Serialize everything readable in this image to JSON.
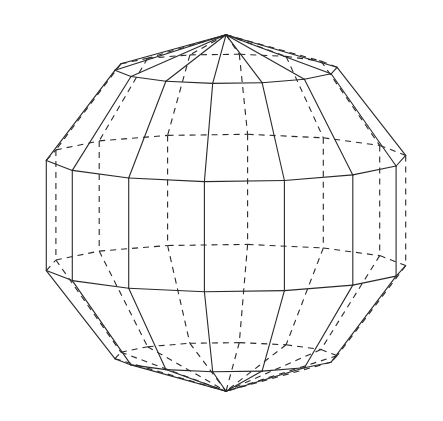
{
  "figure": {
    "canvas": {
      "width": 443,
      "height": 421,
      "background": "#ffffff"
    },
    "sphere": {
      "center": [
        226,
        213
      ],
      "radius_x": 190,
      "radius_y": 180,
      "longitude_segments": 14,
      "latitude_bands": 5,
      "yaw_deg": 6,
      "pitch_deg": 8,
      "line_color": "#2a2a2a",
      "hidden_line_style": "dashed",
      "visible_line_style": "solid"
    },
    "poles": {
      "top": [
        224,
        34
      ],
      "bottom": [
        228,
        393
      ]
    }
  }
}
